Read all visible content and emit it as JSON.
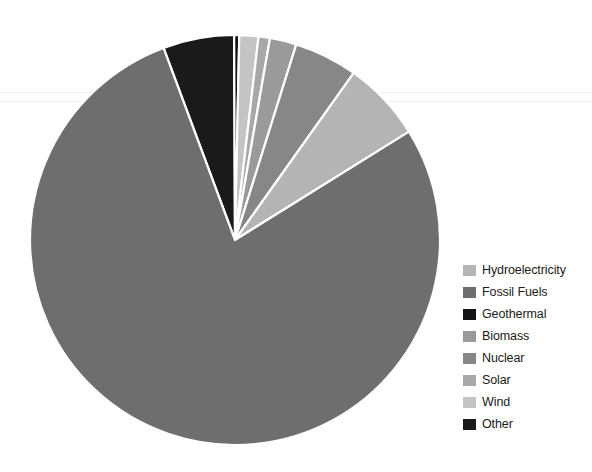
{
  "chart_data": {
    "type": "pie",
    "title": "",
    "subtitle": "",
    "xlabel": "",
    "ylabel": "",
    "legend_position": "right",
    "grid": false,
    "categories": [
      "Hydroelectricity",
      "Fossil Fuels",
      "Geothermal",
      "Biomass",
      "Nuclear",
      "Solar",
      "Wind",
      "Other"
    ],
    "values": [
      6.3,
      78.2,
      0.4,
      2.1,
      5.0,
      0.9,
      1.5,
      5.6
    ],
    "unit": "%",
    "colors": [
      "#b4b4b4",
      "#6e6e6e",
      "#141414",
      "#9a9a9a",
      "#878787",
      "#a8a8a8",
      "#c4c4c4",
      "#1a1a1a"
    ],
    "series": [
      {
        "name": "Energy share",
        "values": [
          6.3,
          78.2,
          0.4,
          2.1,
          5.0,
          0.9,
          1.5,
          5.6
        ]
      }
    ],
    "slices": [
      {
        "label": "Hydroelectricity",
        "value": 6.3,
        "color": "#b4b4b4",
        "start_deg": 291.0,
        "end_deg": 313.7
      },
      {
        "label": "Fossil Fuels",
        "value": 78.2,
        "color": "#6e6e6e",
        "start_deg": 313.7,
        "end_deg": 655.2
      },
      {
        "label": "Geothermal",
        "value": 0.4,
        "color": "#141414",
        "start_deg": 655.2,
        "end_deg": 656.6
      },
      {
        "label": "Biomass",
        "value": 2.1,
        "color": "#9a9a9a",
        "start_deg": 276.4,
        "end_deg": 283.6
      },
      {
        "label": "Nuclear",
        "value": 5.0,
        "color": "#878787",
        "start_deg": 283.6,
        "end_deg": 291.0
      },
      {
        "label": "Solar",
        "value": 0.9,
        "color": "#a8a8a8",
        "start_deg": 273.5,
        "end_deg": 276.4
      },
      {
        "label": "Wind",
        "value": 1.5,
        "color": "#c4c4c4",
        "start_deg": 268.0,
        "end_deg": 273.5
      },
      {
        "label": "Other",
        "value": 5.6,
        "color": "#1a1a1a",
        "start_deg": 266.5,
        "end_deg": 268.0
      }
    ],
    "geometry": {
      "center_x": 235,
      "center_y": 240,
      "radius": 205,
      "separator_color": "#ffffff",
      "separator_width": 2.2,
      "rotation_deg": -90
    }
  },
  "legend": {
    "items": [
      {
        "label": "Hydroelectricity",
        "color": "#b4b4b4"
      },
      {
        "label": "Fossil Fuels",
        "color": "#6e6e6e"
      },
      {
        "label": "Geothermal",
        "color": "#141414"
      },
      {
        "label": "Biomass",
        "color": "#9a9a9a"
      },
      {
        "label": "Nuclear",
        "color": "#878787"
      },
      {
        "label": "Solar",
        "color": "#a8a8a8"
      },
      {
        "label": "Wind",
        "color": "#c4c4c4"
      },
      {
        "label": "Other",
        "color": "#1a1a1a"
      }
    ]
  },
  "background": "#ffffff"
}
